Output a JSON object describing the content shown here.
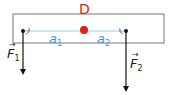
{
  "diagram": {
    "pivot": {
      "label": "D",
      "color": "#e02020"
    },
    "lever_arms": [
      {
        "label": "a",
        "subscript": "1",
        "color": "#3a9ad9"
      },
      {
        "label": "a",
        "subscript": "2",
        "color": "#3a9ad9"
      }
    ],
    "forces": [
      {
        "label": "F",
        "subscript": "1",
        "vector_mark": "→",
        "direction": "down"
      },
      {
        "label": "F",
        "subscript": "2",
        "vector_mark": "→",
        "direction": "down"
      }
    ],
    "colors": {
      "beam": "#666666",
      "arrow": "#111111",
      "arm_line": "#7cc0ea",
      "pivot": "#e02020"
    }
  }
}
